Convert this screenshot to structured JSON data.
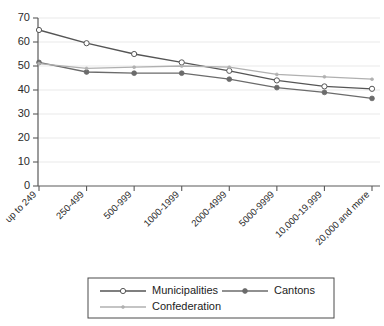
{
  "chart_data": {
    "type": "line",
    "title": "",
    "subtitle": "",
    "xlabel": "",
    "ylabel": "",
    "ylim": [
      0,
      70
    ],
    "ytick_values": [
      0,
      10,
      20,
      30,
      40,
      50,
      60,
      70
    ],
    "ytick_labels": [
      "0",
      "10",
      "20",
      "30",
      "40",
      "50",
      "60",
      "70"
    ],
    "grid": true,
    "grid_axis": "y",
    "legend_position": "bottom",
    "categories": [
      "up to 249",
      "250-499",
      "500-999",
      "1000-1999",
      "2000-4999",
      "5000-9999",
      "10,000-19,999",
      "20,000 and more"
    ],
    "series": [
      {
        "name": "Municipalities",
        "marker": "open-circle",
        "color": "#555555",
        "values": [
          65,
          59.5,
          55,
          51.5,
          48,
          44,
          41.5,
          40.5
        ]
      },
      {
        "name": "Cantons",
        "marker": "filled-circle",
        "color": "#6b6b6b",
        "values": [
          51.5,
          47.5,
          47,
          47,
          44.5,
          41,
          39,
          36.5
        ]
      },
      {
        "name": "Confederation",
        "marker": "small-dot",
        "color": "#b0b0b0",
        "values": [
          51,
          49,
          49.5,
          50,
          49.5,
          46.5,
          45.5,
          44.5
        ]
      }
    ]
  },
  "legend": {
    "entries": [
      {
        "label": "Municipalities"
      },
      {
        "label": "Cantons"
      },
      {
        "label": "Confederation"
      }
    ]
  },
  "colors": {
    "municipalities": "#555555",
    "cantons": "#6b6b6b",
    "confederation": "#b0b0b0",
    "axis": "#5a5a5a",
    "grid": "#e9e9e9"
  }
}
